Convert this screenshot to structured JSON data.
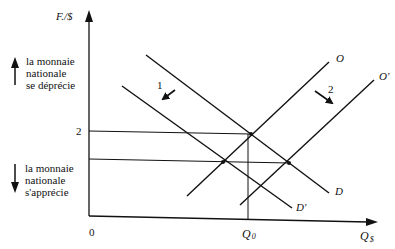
{
  "diagram": {
    "y_axis_label": "F./$",
    "x_axis_label_main": "Q",
    "x_axis_label_sub": "$",
    "origin_label": "0",
    "y_tick_label": "2",
    "q0_label_main": "Q",
    "q0_label_sub": "0",
    "curves": {
      "supply": "O",
      "supply_shifted": "O'",
      "demand": "D",
      "demand_shifted": "D'"
    },
    "shift_labels": {
      "demand_shift": "1",
      "supply_shift": "2"
    },
    "annotations": {
      "depreciation": [
        "la monnaie",
        "nationale",
        "se déprécie"
      ],
      "appreciation": [
        "la monnaie",
        "nationale",
        "s'apprécie"
      ]
    }
  }
}
